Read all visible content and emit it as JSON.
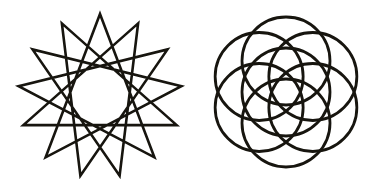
{
  "page": {
    "background_color": "#ffffff",
    "ink_color": "#17150f",
    "width": 381,
    "height": 187
  },
  "figures": [
    {
      "id": "star-polygon",
      "name": "thirteen-pointed-star-polygon",
      "label": "13-pointed star polygon",
      "schlafli": "{13/5}",
      "points": 13,
      "step": 5,
      "center_x": 100,
      "center_y": 96,
      "outer_radius": 82,
      "inner_hole_radius": 30,
      "stroke_width": 2.6,
      "stroke_color": "#17150f",
      "fill": "none",
      "rotation_deg": -90
    },
    {
      "id": "seed-of-life",
      "name": "seven-circle-rosette",
      "label": "Seed of Life rosette",
      "circle_count": 7,
      "center_x": 96,
      "center_y": 92,
      "circle_radius": 44,
      "ring_offset": 31,
      "ring_circles": 6,
      "stroke_width": 2.8,
      "stroke_color": "#17150f",
      "fill": "none",
      "rotation_deg": 0
    }
  ]
}
